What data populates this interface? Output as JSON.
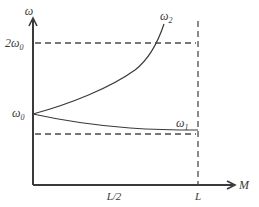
{
  "diagram": {
    "y_axis_label": "ω",
    "x_axis_label": "M",
    "y_ticks": {
      "two_omega0": "2ω",
      "two_omega0_sub": "0",
      "omega0": "ω",
      "omega0_sub": "0"
    },
    "x_ticks": {
      "half": "L/2",
      "full": "L"
    },
    "curves": {
      "upper": {
        "label": "ω",
        "sub": "2"
      },
      "lower": {
        "label": "ω",
        "sub": "1"
      }
    },
    "colors": {
      "ink": "#3a3a3a",
      "dash": "#4a4a4a"
    }
  }
}
